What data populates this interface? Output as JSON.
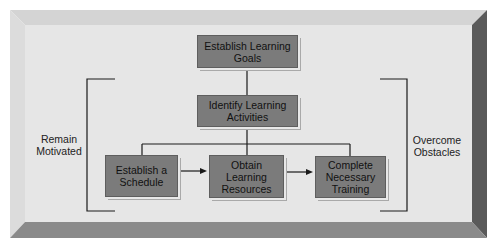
{
  "diagram": {
    "colors": {
      "panel": "#e6e6e6",
      "bevel_light": "#d8d8d8",
      "bevel_dark": "#6a6a6a",
      "box_fill": "#7b7b7b",
      "line": "#1a1a1a"
    },
    "nodes": {
      "goals": {
        "label": "Establish Learning Goals"
      },
      "activities": {
        "label": "Identify Learning Activities"
      },
      "schedule": {
        "label": "Establish a Schedule"
      },
      "resources": {
        "label": "Obtain Learning Resources"
      },
      "training": {
        "label": "Complete Necessary Training"
      }
    },
    "side_labels": {
      "left": "Remain Motivated",
      "right": "Overcome Obstacles"
    },
    "edges": [
      {
        "from": "goals",
        "to": "activities",
        "type": "line"
      },
      {
        "from": "activities",
        "to": "schedule",
        "type": "line"
      },
      {
        "from": "activities",
        "to": "resources",
        "type": "line"
      },
      {
        "from": "activities",
        "to": "training",
        "type": "line"
      },
      {
        "from": "schedule",
        "to": "resources",
        "type": "arrow"
      },
      {
        "from": "resources",
        "to": "training",
        "type": "arrow"
      }
    ]
  }
}
